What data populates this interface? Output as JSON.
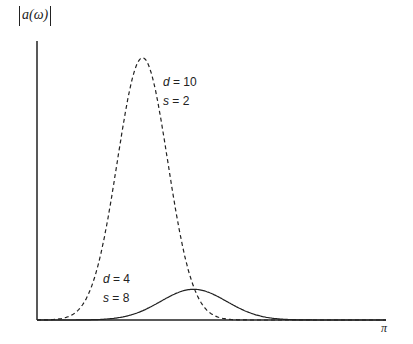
{
  "chart_data": {
    "type": "line",
    "title": "",
    "xlabel": "π",
    "ylabel": "|a(ω)|",
    "xlim": [
      0,
      3.14159
    ],
    "ylim": [
      0,
      1
    ],
    "grid": false,
    "legend": "inline annotations",
    "series": [
      {
        "name": "d = 10, s = 2",
        "style": "dashed",
        "label_d": "d",
        "label_d_value": "= 10",
        "label_s": "s",
        "label_s_value": "= 2",
        "peak_x": 0.95,
        "peak_y": 0.94,
        "width": 0.32
      },
      {
        "name": "d = 4, s = 8",
        "style": "solid",
        "label_d": "d",
        "label_d_value": "= 4",
        "label_s": "s",
        "label_s_value": "= 8",
        "peak_x": 1.41,
        "peak_y": 0.11,
        "width": 0.42
      }
    ]
  },
  "axes": {
    "y_label_text": "a(ω)",
    "x_end_label": "π"
  }
}
